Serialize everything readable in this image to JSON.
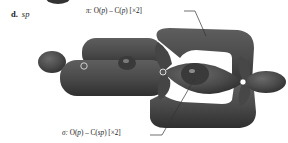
{
  "panel": {
    "letter": "d.",
    "hybridization": "sp"
  },
  "callouts": {
    "pi": {
      "symbol": "π:",
      "o": "O(",
      "o_orb": "p",
      "mid": ") – C(",
      "c_orb": "p",
      "end": ") [×2]"
    },
    "sigma": {
      "symbol": "σ:",
      "o": "O(",
      "o_orb": "p",
      "mid": ") – C(",
      "c_orb": "sp",
      "end": ") [×2]"
    }
  },
  "atoms": [
    {
      "name": "oxygen-left",
      "label": "O"
    },
    {
      "name": "carbon-center",
      "label": "C"
    },
    {
      "name": "oxygen-right",
      "label": "O"
    }
  ],
  "colors": {
    "lobe": "#4a4a4a",
    "lobe_dark": "#363636",
    "lobe_highlight": "#6a6a6a",
    "leader_line": "#333333",
    "background": "#ffffff"
  }
}
